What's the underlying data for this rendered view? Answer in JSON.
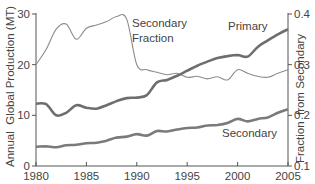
{
  "chart_data": {
    "type": "line",
    "title": "",
    "xlabel": "",
    "ylabel": "Annual  Global Production (MT)",
    "y2label": "Fraction  from Secondary",
    "xlim": [
      1980,
      2005
    ],
    "ylim": [
      0,
      30
    ],
    "y2lim": [
      0.1,
      0.4
    ],
    "x_ticks": [
      1980,
      1985,
      1990,
      1995,
      2000,
      2005
    ],
    "y_ticks": [
      0,
      10,
      20,
      30
    ],
    "y2_ticks": [
      "0.1",
      "0.2",
      "0.3",
      "0.4"
    ],
    "grid": false,
    "legend": "inline labels",
    "x": [
      1980,
      1981,
      1982,
      1983,
      1984,
      1985,
      1986,
      1987,
      1988,
      1989,
      1990,
      1991,
      1992,
      1993,
      1994,
      1995,
      1996,
      1997,
      1998,
      1999,
      2000,
      2001,
      2002,
      2003,
      2004,
      2005
    ],
    "series": [
      {
        "name": "Primary",
        "axis": "left",
        "color": "#6e6e6e",
        "values": [
          12.3,
          12.2,
          10.0,
          10.5,
          12.0,
          11.5,
          11.3,
          12.0,
          12.8,
          13.4,
          13.5,
          14.0,
          16.5,
          17.0,
          17.8,
          18.8,
          19.8,
          20.6,
          21.3,
          21.7,
          21.9,
          21.6,
          23.5,
          24.8,
          26.0,
          27.0
        ]
      },
      {
        "name": "Secondary",
        "axis": "left",
        "color": "#7a7a7a",
        "values": [
          3.8,
          3.9,
          3.7,
          4.1,
          4.2,
          4.5,
          4.6,
          5.0,
          5.6,
          5.8,
          6.3,
          6.0,
          6.9,
          6.8,
          7.2,
          7.5,
          7.6,
          8.0,
          8.1,
          8.5,
          9.3,
          8.8,
          9.3,
          9.6,
          10.5,
          11.2
        ]
      },
      {
        "name": "Secondary Fraction",
        "axis": "right",
        "color": "#8c8c8c",
        "values": [
          0.3,
          0.33,
          0.37,
          0.38,
          0.35,
          0.372,
          0.378,
          0.385,
          0.395,
          0.39,
          0.3,
          0.29,
          0.285,
          0.28,
          0.283,
          0.275,
          0.277,
          0.272,
          0.276,
          0.27,
          0.29,
          0.283,
          0.277,
          0.275,
          0.283,
          0.29
        ]
      }
    ],
    "annotations": [
      {
        "text_line1": "Secondary",
        "text_line2": "Fraction"
      },
      {
        "text": "Primary"
      },
      {
        "text": "Secondary"
      }
    ]
  }
}
